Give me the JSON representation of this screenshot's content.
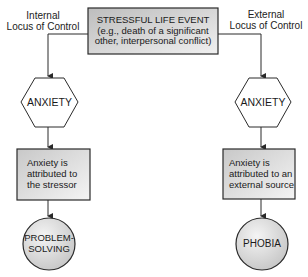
{
  "diagram": {
    "title_box": {
      "line1": "STRESSFUL LIFE EVENT",
      "line2": "(e.g., death of a significant",
      "line3": "other, interpersonal conflict)"
    },
    "left_branch": {
      "label_line1": "Internal",
      "label_line2": "Locus of Control",
      "hexagon": "ANXIETY",
      "box_line1": "Anxiety is",
      "box_line2": "attributed to",
      "box_line3": "the stressor",
      "outcome_line1": "PROBLEM-",
      "outcome_line2": "SOLVING"
    },
    "right_branch": {
      "label_line1": "External",
      "label_line2": "Locus of Control",
      "hexagon": "ANXIETY",
      "box_line1": "Anxiety is",
      "box_line2": "attributed to an",
      "box_line3": "external source",
      "outcome_line1": "PHOBIA"
    },
    "colors": {
      "stroke": "#2a2a2a",
      "fill_light": "#f2f2f2",
      "fill_dark": "#c4c4c4",
      "background": "#ffffff"
    }
  }
}
